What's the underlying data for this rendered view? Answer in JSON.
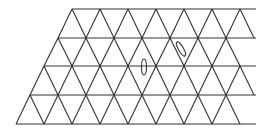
{
  "figure": {
    "stroke_color": "#333333",
    "background": "#ffffff",
    "rows": 4,
    "horizontal_lines_y": [
      9,
      38,
      66,
      95,
      124
    ],
    "triangle_side_px": 28,
    "top_left_x": 72,
    "bottom_left_x": 16,
    "right_edge_x": 256,
    "defects": [
      {
        "cx": 144,
        "cy": 67,
        "rx": 2.5,
        "ry": 8,
        "rotate": 0
      },
      {
        "cx": 181,
        "cy": 49,
        "rx": 2.5,
        "ry": 8,
        "rotate": -30
      }
    ]
  }
}
